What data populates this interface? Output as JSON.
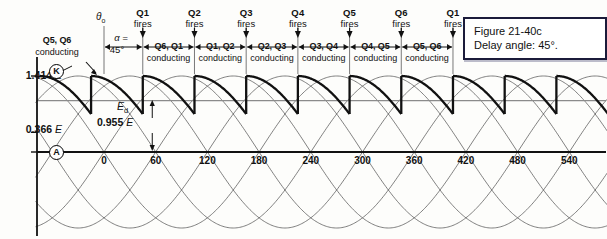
{
  "caption": {
    "line1": "Figure 21-40c",
    "line2": "Delay angle: 45°."
  },
  "axes": {
    "y_labels": [
      {
        "text": "1.414",
        "unit": "E",
        "value": 1.414
      },
      {
        "text": "0.366",
        "unit": "E",
        "value": 0.366
      },
      {
        "text": "0",
        "unit": "",
        "value": 0
      }
    ],
    "x_ticks": [
      "0",
      "60",
      "120",
      "180",
      "240",
      "300",
      "360",
      "420",
      "480",
      "540"
    ],
    "x_unit": "degrees"
  },
  "annotations": {
    "theta_symbol": "θ",
    "theta_sub": "o",
    "alpha_symbol": "α =",
    "alpha_value": "45°",
    "ed_symbol": "E",
    "ed_sub": "d",
    "ed_value": "0.955",
    "ed_unit": "E",
    "node_k": "K",
    "node_a": "A",
    "first_pair_line1": "Q5, Q6",
    "first_pair_line2": "conducting",
    "conducting_word": "conducting",
    "fires_word": "fires"
  },
  "firing_events": [
    {
      "label": "Q1",
      "angle": 45
    },
    {
      "label": "Q2",
      "angle": 105
    },
    {
      "label": "Q3",
      "angle": 165
    },
    {
      "label": "Q4",
      "angle": 225
    },
    {
      "label": "Q5",
      "angle": 285
    },
    {
      "label": "Q6",
      "angle": 345
    },
    {
      "label": "Q1",
      "angle": 405
    }
  ],
  "conducting_pairs": [
    {
      "label": "Q6, Q1",
      "start": 45,
      "end": 105
    },
    {
      "label": "Q1, Q2",
      "start": 105,
      "end": 165
    },
    {
      "label": "Q2, Q3",
      "start": 165,
      "end": 225
    },
    {
      "label": "Q3, Q4",
      "start": 225,
      "end": 285
    },
    {
      "label": "Q4, Q5",
      "start": 285,
      "end": 345
    },
    {
      "label": "Q5, Q6",
      "start": 345,
      "end": 405
    }
  ],
  "colors": {
    "ink": "#111111",
    "thin_curve": "#555555",
    "average_line": "#8b8b8b",
    "caption_border": "#1b1b3a",
    "background": "#fdfdfb"
  },
  "chart_data": {
    "type": "line",
    "xlabel": "degrees",
    "ylabel": "E",
    "xlim": [
      -85,
      590
    ],
    "ylim": [
      -1.414,
      1.414
    ],
    "grid": false,
    "legend": "none",
    "peak": 1.414,
    "average_output": 0.955,
    "ripple_min": 0.366,
    "delay_angle_deg": 45,
    "phase_count": 6,
    "phase_spacing_deg": 60,
    "conduction_interval_deg": 60,
    "series": [
      {
        "name": "line voltage 1",
        "type": "sine",
        "amplitude": 1.414,
        "period_deg": 360,
        "phase_deg": 0
      },
      {
        "name": "line voltage 2",
        "type": "sine",
        "amplitude": 1.414,
        "period_deg": 360,
        "phase_deg": 60
      },
      {
        "name": "line voltage 3",
        "type": "sine",
        "amplitude": 1.414,
        "period_deg": 360,
        "phase_deg": 120
      },
      {
        "name": "line voltage 4",
        "type": "sine",
        "amplitude": 1.414,
        "period_deg": 360,
        "phase_deg": 180
      },
      {
        "name": "line voltage 5",
        "type": "sine",
        "amplitude": 1.414,
        "period_deg": 360,
        "phase_deg": 240
      },
      {
        "name": "line voltage 6",
        "type": "sine",
        "amplitude": 1.414,
        "period_deg": 360,
        "phase_deg": 300
      },
      {
        "name": "rectified output Ed",
        "type": "piecewise-sine",
        "bold": true,
        "amplitude": 1.414,
        "segment_span_deg": 60,
        "segment_starts_deg": [
          -75,
          -15,
          45,
          105,
          165,
          225,
          285,
          345,
          405,
          465,
          525
        ],
        "note": "each segment follows its phase sinusoid from firing point for 60 degrees, then drops vertically"
      }
    ],
    "x_ticks": [
      0,
      60,
      120,
      180,
      240,
      300,
      360,
      420,
      480,
      540
    ],
    "y_ticks": [
      0,
      0.366,
      1.414
    ]
  }
}
